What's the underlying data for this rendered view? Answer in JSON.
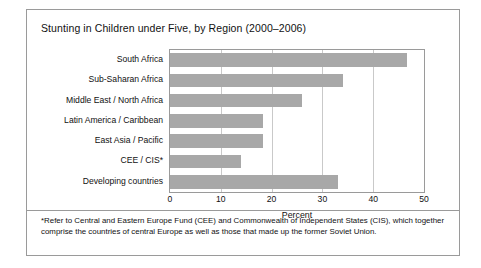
{
  "figure": {
    "title": "Stunting in Children under Five, by Region (2000–2006)",
    "footnote": "*Refer to Central and Eastern Europe Fund (CEE) and Commonwealth of Independent States (CIS), which together comprise the countries of central Europe as well as those that made up the former Soviet Union.",
    "bar_color": "#a8a8a8",
    "frame_color": "#9a9a9a",
    "grid_color": "#c9c9c9"
  },
  "chart_data": {
    "type": "bar",
    "orientation": "horizontal",
    "title": "Stunting in Children under Five, by Region (2000–2006)",
    "xlabel": "Percent",
    "ylabel": "",
    "xlim": [
      0,
      50
    ],
    "xticks": [
      0,
      10,
      20,
      30,
      40,
      50
    ],
    "xtick_labels": [
      "0",
      "10",
      "20",
      "30",
      "40",
      "50"
    ],
    "grid": true,
    "legend": false,
    "categories": [
      "South Africa",
      "Sub-Saharan Africa",
      "Middle East / North Africa",
      "Latin America / Caribbean",
      "East Asia / Pacific",
      "CEE / CIS*",
      "Developing countries"
    ],
    "values": [
      46.7,
      34,
      26,
      18.3,
      18.3,
      14,
      33
    ]
  }
}
